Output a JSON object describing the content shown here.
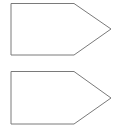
{
  "diagram": {
    "shapes": [
      {
        "type": "pentagon-arrow",
        "points": "11,3.5 74,3.5 111,29 74,55 11,55"
      },
      {
        "type": "pentagon-arrow",
        "points": "11,71.5 74,71.5 111,98 74,124 11,124"
      }
    ],
    "stroke_color": "#7a7a7a",
    "fill_color": "#ffffff"
  }
}
